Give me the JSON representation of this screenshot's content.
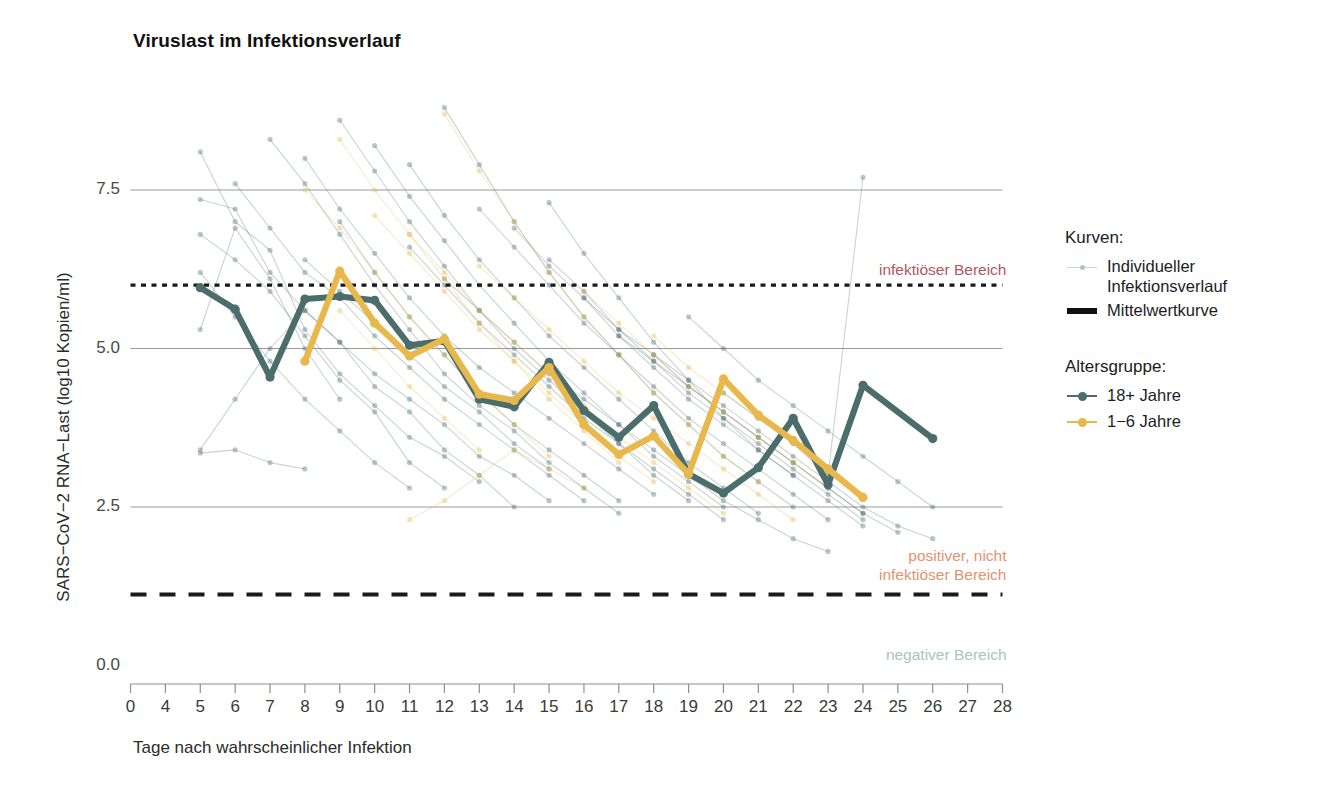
{
  "chart": {
    "title": "Viruslast im Infektionsverlauf",
    "xlabel": "Tage nach wahrscheinlicher Infektion",
    "ylabel": "SARS−CoV−2 RNA−Last (log10 Kopien/ml)"
  },
  "legend": {
    "curves_heading": "Kurven:",
    "individual_label_line1": "Individueller",
    "individual_label_line2": "Infektionsverlauf",
    "mean_label": "Mittelwertkurve",
    "age_heading": "Altersgruppe:",
    "adults_label": "18+ Jahre",
    "children_label": "1−6 Jahre"
  },
  "bands": {
    "infectious": "infektiöser Bereich",
    "positive_line1": "positiver, nicht",
    "positive_line2": "infektiöser Bereich",
    "negative": "negativer Bereich"
  },
  "colors": {
    "adults": "#4b6d6c",
    "children": "#e8b84c",
    "infectious_text": "#b4565c",
    "positive_text": "#e2936f",
    "negative_text": "#a9c5bd",
    "threshold": "#1a1a1a",
    "grid": "#9a9a9a"
  },
  "chart_data": {
    "type": "line",
    "title": "Viruslast im Infektionsverlauf",
    "xlabel": "Tage nach wahrscheinlicher Infektion",
    "ylabel": "SARS−CoV−2 RNA−Last (log10 Kopien/ml)",
    "grid": true,
    "legend_position": "right",
    "xticks": [
      0,
      4,
      5,
      6,
      7,
      8,
      9,
      10,
      11,
      12,
      13,
      14,
      15,
      16,
      17,
      18,
      19,
      20,
      21,
      22,
      23,
      24,
      25,
      26,
      27,
      28
    ],
    "xtick_labels": [
      "0",
      "4",
      "5",
      "6",
      "7",
      "8",
      "9",
      "10",
      "11",
      "12",
      "13",
      "14",
      "15",
      "16",
      "17",
      "18",
      "19",
      "20",
      "21",
      "22",
      "23",
      "24",
      "25",
      "26",
      "27",
      "28"
    ],
    "yticks": [
      0.0,
      2.5,
      5.0,
      7.5
    ],
    "ytick_labels": [
      "0.0",
      "2.5",
      "5.0",
      "7.5"
    ],
    "ylim": [
      0.0,
      8.85
    ],
    "series": [
      {
        "name": "18+ Jahre",
        "color": "#4b6d6c",
        "kind": "mean",
        "x": [
          5,
          6,
          7,
          8,
          9,
          10,
          11,
          12,
          13,
          14,
          15,
          16,
          17,
          18,
          19,
          20,
          21,
          22,
          23,
          24,
          26
        ],
        "values": [
          5.96,
          5.62,
          4.55,
          5.78,
          5.82,
          5.76,
          5.05,
          5.12,
          4.2,
          4.08,
          4.78,
          4.02,
          3.6,
          4.1,
          3.02,
          2.72,
          3.12,
          3.9,
          2.85,
          4.42,
          3.58
        ]
      },
      {
        "name": "1−6 Jahre",
        "color": "#e8b84c",
        "kind": "mean",
        "x": [
          8,
          9,
          10,
          11,
          12,
          13,
          14,
          15,
          16,
          17,
          18,
          19,
          20,
          21,
          22,
          23,
          24
        ],
        "values": [
          4.8,
          6.22,
          5.4,
          4.88,
          5.15,
          4.28,
          4.18,
          4.7,
          3.8,
          3.33,
          3.62,
          3.02,
          4.52,
          3.95,
          3.55,
          3.1,
          2.65
        ]
      }
    ],
    "thresholds": [
      {
        "name": "infektiöser Bereich",
        "y": 6.0,
        "style": "dotted",
        "label": "infektiöser Bereich",
        "label_color": "#b4565c"
      },
      {
        "name": "positiver, nicht infektiöser Bereich",
        "y": 1.12,
        "style": "dashed",
        "label": "positiver, nicht infektiöser Bereich",
        "label_color": "#e2936f"
      },
      {
        "name": "negativer Bereich",
        "y": 0.0,
        "style": "none",
        "label": "negativer Bereich",
        "label_color": "#a9c5bd"
      }
    ],
    "individual_curves_note": "Faint individual infection trajectories (one polyline per subject) are drawn underneath the two mean curves, colored by age group (teal for 18+ Jahre, amber for 1−6 Jahre) at low opacity.",
    "individual_curves": {
      "adults": [
        {
          "x": [
            5,
            6,
            7,
            8,
            9,
            10,
            11,
            12,
            13
          ],
          "y": [
            8.1,
            7.0,
            6.55,
            5.3,
            4.6,
            4.1,
            3.6,
            3.3,
            2.9
          ]
        },
        {
          "x": [
            5,
            6,
            7,
            8,
            9,
            10,
            11,
            12,
            13,
            14
          ],
          "y": [
            7.35,
            7.2,
            6.2,
            5.6,
            5.1,
            4.4,
            4.0,
            3.4,
            3.0,
            2.5
          ]
        },
        {
          "x": [
            5,
            6,
            7,
            8,
            9,
            10,
            11,
            12
          ],
          "y": [
            6.8,
            6.4,
            5.9,
            5.2,
            4.5,
            4.0,
            3.2,
            2.8
          ]
        },
        {
          "x": [
            5,
            6,
            7,
            8,
            9,
            10,
            11,
            12,
            13,
            14,
            15
          ],
          "y": [
            3.4,
            4.2,
            5.0,
            5.6,
            5.1,
            4.6,
            4.2,
            3.8,
            3.3,
            3.0,
            2.6
          ]
        },
        {
          "x": [
            5,
            6,
            7,
            8,
            9
          ],
          "y": [
            5.3,
            6.9,
            6.1,
            5.0,
            4.2
          ]
        },
        {
          "x": [
            6,
            7,
            8,
            9,
            10,
            11,
            12,
            13,
            14,
            15,
            16
          ],
          "y": [
            7.6,
            6.9,
            6.2,
            5.8,
            5.2,
            4.7,
            4.2,
            3.8,
            3.4,
            3.0,
            2.6
          ]
        },
        {
          "x": [
            7,
            8,
            9,
            10,
            11,
            12,
            13,
            14,
            15,
            16,
            17
          ],
          "y": [
            8.3,
            7.6,
            6.8,
            6.0,
            5.3,
            4.6,
            4.1,
            3.7,
            3.2,
            2.8,
            2.4
          ]
        },
        {
          "x": [
            8,
            9,
            10,
            11,
            12,
            13,
            14,
            15,
            16,
            17,
            18
          ],
          "y": [
            8.0,
            7.2,
            6.5,
            5.8,
            5.2,
            4.7,
            4.3,
            3.9,
            3.5,
            3.1,
            2.7
          ]
        },
        {
          "x": [
            9,
            10,
            11,
            12,
            13,
            14,
            15,
            16,
            17,
            18,
            19
          ],
          "y": [
            8.6,
            7.8,
            7.0,
            6.3,
            5.6,
            5.0,
            4.5,
            4.0,
            3.5,
            3.0,
            2.6
          ]
        },
        {
          "x": [
            10,
            11,
            12,
            13,
            14,
            15,
            16,
            17,
            18,
            19,
            20
          ],
          "y": [
            8.2,
            7.4,
            6.7,
            6.0,
            5.4,
            4.8,
            4.3,
            3.8,
            3.3,
            2.9,
            2.5
          ]
        },
        {
          "x": [
            11,
            12,
            13,
            14,
            15,
            16,
            17,
            18,
            19,
            20,
            21
          ],
          "y": [
            7.9,
            7.1,
            6.4,
            5.8,
            5.2,
            4.7,
            4.2,
            3.7,
            3.2,
            2.8,
            2.4
          ]
        },
        {
          "x": [
            12,
            13,
            14,
            15,
            16,
            17,
            18,
            19,
            20,
            21,
            22
          ],
          "y": [
            8.8,
            7.9,
            7.0,
            6.2,
            5.5,
            4.9,
            4.3,
            3.8,
            3.3,
            2.9,
            2.5
          ]
        },
        {
          "x": [
            13,
            14,
            15,
            16,
            17,
            18,
            19,
            20,
            21,
            22,
            23
          ],
          "y": [
            7.2,
            6.6,
            6.0,
            5.4,
            4.9,
            4.4,
            3.9,
            3.5,
            3.1,
            2.7,
            2.3
          ]
        },
        {
          "x": [
            14,
            15,
            16,
            17,
            18,
            19,
            20,
            21,
            22,
            23,
            24
          ],
          "y": [
            6.9,
            6.3,
            5.8,
            5.2,
            4.7,
            4.2,
            3.8,
            3.4,
            3.0,
            2.6,
            2.2
          ]
        },
        {
          "x": [
            15,
            16,
            17,
            18,
            19,
            20,
            21,
            22,
            23,
            24
          ],
          "y": [
            6.4,
            5.9,
            5.3,
            4.8,
            4.3,
            3.9,
            3.5,
            3.1,
            2.7,
            2.3
          ]
        },
        {
          "x": [
            16,
            17,
            18,
            19,
            20,
            21,
            22,
            23,
            24,
            25
          ],
          "y": [
            5.8,
            5.3,
            4.9,
            4.4,
            4.0,
            3.6,
            3.2,
            2.8,
            2.4,
            2.1
          ]
        },
        {
          "x": [
            17,
            18,
            19,
            20,
            21,
            22,
            23,
            24
          ],
          "y": [
            5.2,
            4.8,
            4.4,
            4.0,
            3.6,
            3.2,
            2.8,
            2.4
          ]
        },
        {
          "x": [
            18,
            19,
            20,
            21,
            22,
            23,
            24,
            25,
            26
          ],
          "y": [
            4.9,
            4.5,
            4.1,
            3.7,
            3.3,
            2.9,
            2.5,
            2.2,
            2.0
          ]
        },
        {
          "x": [
            20,
            21,
            22,
            23,
            24
          ],
          "y": [
            4.3,
            3.9,
            3.5,
            3.0,
            7.7
          ]
        },
        {
          "x": [
            5,
            6,
            7,
            8,
            9,
            10,
            11
          ],
          "y": [
            6.2,
            5.5,
            4.8,
            4.2,
            3.7,
            3.2,
            2.8
          ]
        },
        {
          "x": [
            5,
            6,
            7,
            8
          ],
          "y": [
            3.35,
            3.4,
            3.2,
            3.1
          ]
        },
        {
          "x": [
            9,
            10,
            11,
            12,
            13,
            14,
            15,
            16,
            17
          ],
          "y": [
            7.0,
            6.2,
            5.5,
            4.9,
            4.3,
            3.8,
            3.4,
            3.0,
            2.6
          ]
        },
        {
          "x": [
            11,
            12,
            13,
            14,
            15,
            16,
            17,
            18,
            19,
            20
          ],
          "y": [
            6.6,
            6.0,
            5.4,
            4.9,
            4.4,
            3.9,
            3.5,
            3.1,
            2.7,
            2.3
          ]
        },
        {
          "x": [
            8,
            9,
            10,
            11,
            12,
            13,
            14,
            15
          ],
          "y": [
            6.4,
            5.9,
            5.4,
            4.9,
            4.4,
            4.0,
            3.5,
            3.1
          ]
        },
        {
          "x": [
            12,
            13,
            14,
            15,
            16,
            17,
            18,
            19,
            20,
            21,
            22,
            23
          ],
          "y": [
            6.1,
            5.6,
            5.1,
            4.6,
            4.2,
            3.8,
            3.4,
            3.0,
            2.6,
            2.3,
            2.0,
            1.8
          ]
        },
        {
          "x": [
            15,
            16,
            17,
            18,
            19,
            20,
            21,
            22
          ],
          "y": [
            7.3,
            6.5,
            5.8,
            5.1,
            4.5,
            3.9,
            3.4,
            3.0
          ]
        },
        {
          "x": [
            19,
            20,
            21,
            22,
            23,
            24,
            25,
            26
          ],
          "y": [
            5.5,
            5.0,
            4.5,
            4.1,
            3.7,
            3.3,
            2.9,
            2.5
          ]
        }
      ],
      "children": [
        {
          "x": [
            8,
            9,
            10,
            11,
            12,
            13,
            14,
            15
          ],
          "y": [
            7.5,
            6.9,
            6.2,
            5.5,
            4.9,
            4.3,
            3.8,
            3.3
          ]
        },
        {
          "x": [
            9,
            10,
            11,
            12,
            13,
            14,
            15,
            16,
            17
          ],
          "y": [
            8.3,
            7.5,
            6.8,
            6.1,
            5.4,
            4.8,
            4.2,
            3.7,
            3.2
          ]
        },
        {
          "x": [
            10,
            11,
            12,
            13,
            14,
            15,
            16,
            17,
            18
          ],
          "y": [
            7.1,
            6.5,
            5.9,
            5.3,
            4.8,
            4.3,
            3.8,
            3.3,
            2.9
          ]
        },
        {
          "x": [
            11,
            12,
            13,
            14,
            15,
            16,
            17,
            18,
            19,
            20
          ],
          "y": [
            6.8,
            6.2,
            5.6,
            5.1,
            4.6,
            4.1,
            3.6,
            3.2,
            2.8,
            2.4
          ]
        },
        {
          "x": [
            12,
            13,
            14,
            15,
            16,
            17,
            18,
            19,
            20,
            21
          ],
          "y": [
            8.7,
            7.8,
            7.0,
            6.2,
            5.5,
            4.9,
            4.3,
            3.8,
            3.3,
            2.9
          ]
        },
        {
          "x": [
            13,
            14,
            15,
            16,
            17,
            18,
            19,
            20,
            21,
            22
          ],
          "y": [
            6.3,
            5.8,
            5.3,
            4.8,
            4.3,
            3.9,
            3.5,
            3.1,
            2.7,
            2.3
          ]
        },
        {
          "x": [
            9,
            10,
            11,
            12,
            13
          ],
          "y": [
            5.6,
            5.0,
            4.4,
            3.9,
            3.4
          ]
        },
        {
          "x": [
            11,
            12,
            13,
            14,
            15,
            16
          ],
          "y": [
            2.3,
            2.6,
            3.0,
            3.4,
            3.1,
            2.8
          ]
        },
        {
          "x": [
            16,
            17,
            18,
            19,
            20,
            21,
            22,
            23
          ],
          "y": [
            5.9,
            5.4,
            4.9,
            4.4,
            4.0,
            3.6,
            3.2,
            2.8
          ]
        },
        {
          "x": [
            18,
            19,
            20,
            21,
            22,
            23,
            24
          ],
          "y": [
            5.2,
            4.7,
            4.3,
            3.9,
            3.5,
            3.1,
            2.7
          ]
        }
      ]
    }
  }
}
